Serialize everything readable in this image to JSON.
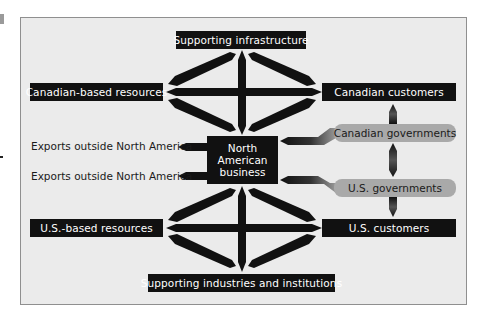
{
  "diagram": {
    "top_node": "Supporting infrastructure",
    "bottom_node": "Supporting industries and institutions",
    "left_top_node": "Canadian-based resources",
    "left_bottom_node": "U.S.-based resources",
    "right_top_node": "Canadian customers",
    "right_bottom_node": "U.S. customers",
    "center_node": {
      "line1": "North",
      "line2": "American",
      "line3": "business"
    },
    "gov_nodes": {
      "canadian": "Canadian governments",
      "us": "U.S. governments"
    },
    "exports": {
      "first": "Exports outside North America",
      "second": "Exports outside North America"
    }
  },
  "colors": {
    "box_fill": "#111111",
    "box_text": "#ffffff",
    "gov_fill": "#a9a9a9",
    "panel_bg": "#ebebeb",
    "panel_border": "#8f8f8f"
  }
}
